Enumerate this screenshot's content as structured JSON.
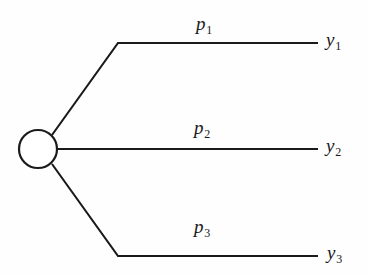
{
  "diagram": {
    "type": "tree",
    "background_color": "#fefefe",
    "stroke_color": "#1a1a1a",
    "node": {
      "shape": "circle",
      "name": "source-node",
      "cx": 38,
      "cy": 149,
      "r": 19
    },
    "branches": [
      {
        "id": "branch-1",
        "probability_label": "p",
        "probability_subscript": "1",
        "outcome_label": "y",
        "outcome_subscript": "1",
        "path": "M 52 135 L 118 43 L 318 43"
      },
      {
        "id": "branch-2",
        "probability_label": "p",
        "probability_subscript": "2",
        "outcome_label": "y",
        "outcome_subscript": "2",
        "path": "M 57 149 L 318 149"
      },
      {
        "id": "branch-3",
        "probability_label": "p",
        "probability_subscript": "3",
        "outcome_label": "y",
        "outcome_subscript": "3",
        "path": "M 52 164 L 118 256 L 318 256"
      }
    ]
  }
}
